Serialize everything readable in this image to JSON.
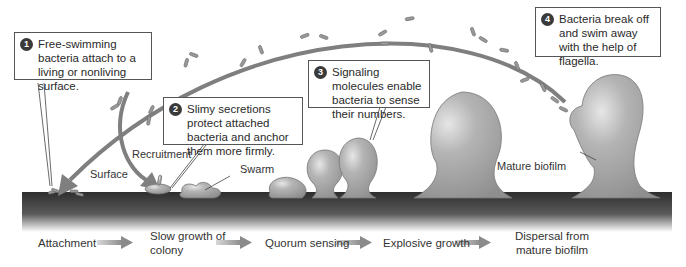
{
  "callouts": [
    {
      "number": "1",
      "text": "Free-swimming bacteria attach to a living or nonliving surface."
    },
    {
      "number": "2",
      "text": "Slimy secretions protect attached bacteria and anchor them more firmly."
    },
    {
      "number": "3",
      "text": "Signaling molecules enable bacteria to sense their numbers."
    },
    {
      "number": "4",
      "text": "Bacteria break off and swim away with the help of flagella."
    }
  ],
  "labels": {
    "recruitment": "Recruitment",
    "surface": "Surface",
    "swarm": "Swarm",
    "mature_biofilm": "Mature biofilm"
  },
  "stages": [
    {
      "label": "Attachment"
    },
    {
      "label": "Slow growth of colony"
    },
    {
      "label": "Quorum sensing"
    },
    {
      "label": "Explosive growth"
    },
    {
      "label": "Dispersal from mature biofilm"
    }
  ],
  "colors": {
    "arrow": "#7a7a7a",
    "surface": "#3a3a3a",
    "biofilm": "#a8a8a8"
  }
}
